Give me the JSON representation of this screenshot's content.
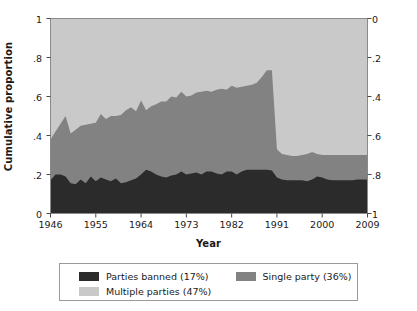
{
  "chart_data": {
    "type": "area",
    "stacked": true,
    "title": "",
    "xlabel": "Year",
    "ylabel": "Cumulative proportion",
    "xlim": [
      1946,
      2009
    ],
    "ylim": [
      0,
      1
    ],
    "grid": false,
    "legend_position": "bottom",
    "axis_left": {
      "label": "Cumulative proportion",
      "ticks": [
        0,
        0.2,
        0.4,
        0.6,
        0.8,
        1
      ],
      "tick_labels": [
        "0",
        ".2",
        ".4",
        ".6",
        ".8",
        "1"
      ],
      "direction": "normal"
    },
    "axis_right": {
      "label": "",
      "ticks": [
        0,
        0.2,
        0.4,
        0.6,
        0.8,
        1
      ],
      "tick_labels": [
        "0",
        ".2",
        ".4",
        ".6",
        ".8",
        "1"
      ],
      "direction": "inverted"
    },
    "axis_bottom": {
      "label": "Year",
      "ticks": [
        1946,
        1955,
        1964,
        1973,
        1982,
        1991,
        2000,
        2009
      ],
      "tick_labels": [
        "1946",
        "1955",
        "1964",
        "1973",
        "1982",
        "1991",
        "2000",
        "2009"
      ]
    },
    "colors": {
      "parties_banned": "#2b2b2b",
      "single_party": "#828282",
      "multiple_parties": "#c9c9c9",
      "plot_border": "#8a8a8a",
      "background": "#ffffff"
    },
    "x": [
      1946,
      1947,
      1948,
      1949,
      1950,
      1951,
      1952,
      1953,
      1954,
      1955,
      1956,
      1957,
      1958,
      1959,
      1960,
      1961,
      1962,
      1963,
      1964,
      1965,
      1966,
      1967,
      1968,
      1969,
      1970,
      1971,
      1972,
      1973,
      1974,
      1975,
      1976,
      1977,
      1978,
      1979,
      1980,
      1981,
      1982,
      1983,
      1984,
      1985,
      1986,
      1987,
      1988,
      1989,
      1990,
      1991,
      1992,
      1993,
      1994,
      1995,
      1996,
      1997,
      1998,
      1999,
      2000,
      2001,
      2002,
      2003,
      2004,
      2005,
      2006,
      2007,
      2008,
      2009
    ],
    "series": [
      {
        "name": "Parties banned (17%)",
        "label": "Parties banned (17%)",
        "share": 0.17,
        "color": "#2b2b2b",
        "values": [
          0.17,
          0.2,
          0.2,
          0.19,
          0.155,
          0.15,
          0.175,
          0.155,
          0.19,
          0.165,
          0.185,
          0.175,
          0.165,
          0.18,
          0.155,
          0.16,
          0.17,
          0.18,
          0.2,
          0.225,
          0.215,
          0.2,
          0.19,
          0.185,
          0.195,
          0.2,
          0.215,
          0.2,
          0.205,
          0.21,
          0.2,
          0.215,
          0.215,
          0.205,
          0.2,
          0.215,
          0.215,
          0.2,
          0.215,
          0.225,
          0.225,
          0.225,
          0.225,
          0.225,
          0.22,
          0.185,
          0.175,
          0.17,
          0.17,
          0.17,
          0.17,
          0.165,
          0.175,
          0.19,
          0.185,
          0.175,
          0.17,
          0.17,
          0.17,
          0.17,
          0.17,
          0.175,
          0.175,
          0.175
        ]
      },
      {
        "name": "Single party (36%)",
        "label": "Single party (36%)",
        "share": 0.36,
        "color": "#828282",
        "cumulative_top": [
          0.38,
          0.42,
          0.46,
          0.5,
          0.41,
          0.43,
          0.45,
          0.455,
          0.46,
          0.465,
          0.51,
          0.485,
          0.5,
          0.5,
          0.505,
          0.53,
          0.545,
          0.525,
          0.58,
          0.53,
          0.55,
          0.56,
          0.575,
          0.575,
          0.6,
          0.595,
          0.625,
          0.6,
          0.605,
          0.62,
          0.625,
          0.63,
          0.625,
          0.635,
          0.64,
          0.635,
          0.655,
          0.645,
          0.65,
          0.655,
          0.66,
          0.67,
          0.7,
          0.735,
          0.735,
          0.33,
          0.305,
          0.3,
          0.295,
          0.295,
          0.3,
          0.305,
          0.315,
          0.305,
          0.3,
          0.3,
          0.3,
          0.3,
          0.3,
          0.3,
          0.3,
          0.3,
          0.3,
          0.3
        ]
      },
      {
        "name": "Multiple parties (47%)",
        "label": "Multiple parties (47%)",
        "share": 0.47,
        "color": "#c9c9c9",
        "cumulative_top": [
          1,
          1,
          1,
          1,
          1,
          1,
          1,
          1,
          1,
          1,
          1,
          1,
          1,
          1,
          1,
          1,
          1,
          1,
          1,
          1,
          1,
          1,
          1,
          1,
          1,
          1,
          1,
          1,
          1,
          1,
          1,
          1,
          1,
          1,
          1,
          1,
          1,
          1,
          1,
          1,
          1,
          1,
          1,
          1,
          1,
          1,
          1,
          1,
          1,
          1,
          1,
          1,
          1,
          1,
          1,
          1,
          1,
          1,
          1,
          1,
          1,
          1,
          1,
          1
        ]
      }
    ]
  },
  "legend": {
    "entries": [
      {
        "label": "Parties banned (17%)",
        "color": "#2b2b2b"
      },
      {
        "label": "Single party (36%)",
        "color": "#828282"
      },
      {
        "label": "Multiple parties (47%)",
        "color": "#c9c9c9"
      }
    ]
  }
}
